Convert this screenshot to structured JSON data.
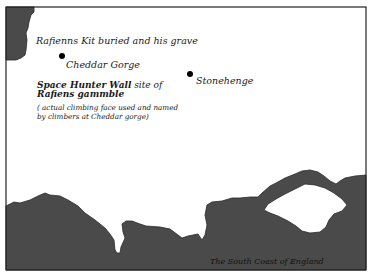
{
  "map": {
    "title": "Rafienns Kit buried and his grave",
    "places": [
      {
        "name": "Cheddar Gorge",
        "x": 62,
        "y": 56
      },
      {
        "name": "Stonehenge",
        "x": 190,
        "y": 74
      }
    ],
    "wall": {
      "name": "Space Hunter Wall",
      "suffix": " site of",
      "line2": "Rafiens gammble"
    },
    "note": {
      "line1": "( actual climbing face used and named",
      "line2": "by climbers at Cheddar gorge)"
    },
    "coast_label": "The South Coast of England",
    "colors": {
      "land": "#4a4a4a",
      "sea": "#ffffff",
      "border": "#222222",
      "text": "#1a1a1a"
    }
  }
}
